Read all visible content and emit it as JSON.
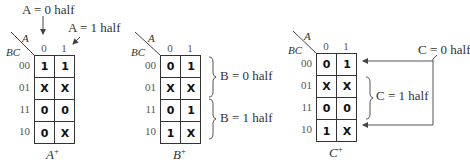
{
  "maps": [
    {
      "id": "a-plus",
      "title": "A",
      "title_sup": "+",
      "row_var": "BC",
      "col_var": "A",
      "cols": [
        "0",
        "1"
      ],
      "rows": [
        "00",
        "01",
        "11",
        "10"
      ],
      "cells": [
        [
          "1",
          "1"
        ],
        [
          "X",
          "X"
        ],
        [
          "0",
          "0"
        ],
        [
          "0",
          "X"
        ]
      ]
    },
    {
      "id": "b-plus",
      "title": "B",
      "title_sup": "+",
      "row_var": "BC",
      "col_var": "A",
      "cols": [
        "0",
        "1"
      ],
      "rows": [
        "00",
        "01",
        "11",
        "10"
      ],
      "cells": [
        [
          "0",
          "1"
        ],
        [
          "X",
          "X"
        ],
        [
          "0",
          "1"
        ],
        [
          "1",
          "X"
        ]
      ]
    },
    {
      "id": "c-plus",
      "title": "C",
      "title_sup": "+",
      "row_var": "BC",
      "col_var": "A",
      "cols": [
        "0",
        "1"
      ],
      "rows": [
        "00",
        "01",
        "11",
        "10"
      ],
      "cells": [
        [
          "0",
          "1"
        ],
        [
          "X",
          "X"
        ],
        [
          "0",
          "0"
        ],
        [
          "1",
          "X"
        ]
      ]
    }
  ],
  "annotations": {
    "a0_half": "A = 0 half",
    "a1_half": "A = 1 half",
    "b0_half": "B = 0 half",
    "b1_half": "B = 1 half",
    "c0_half": "C = 0 half",
    "c1_half": "C = 1 half"
  }
}
